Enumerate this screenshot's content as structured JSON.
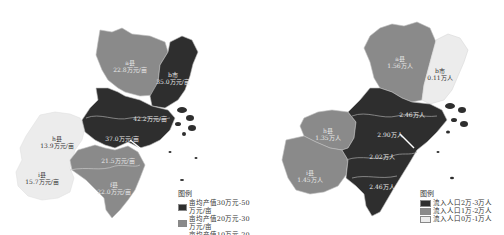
{
  "colors": {
    "dark": "#2e2e2e",
    "mid": "#8a8a8a",
    "light": "#ececec",
    "border": "#bdbdbd"
  },
  "left_map": {
    "regions": [
      {
        "id": "a",
        "name": "a县",
        "value": "22.8万元/亩",
        "class": "mid"
      },
      {
        "id": "b",
        "name": "b市",
        "value": "35.0万元/亩",
        "class": "dark"
      },
      {
        "id": "c",
        "name": "c区",
        "value": "42.2万元/亩",
        "class": "dark"
      },
      {
        "id": "d",
        "name": "d区",
        "value": "37.0万元/亩",
        "class": "dark"
      },
      {
        "id": "e",
        "name": "e县",
        "value": "21.5万元/亩",
        "class": "mid"
      },
      {
        "id": "f",
        "name": "f县",
        "value": "22.0万元/亩",
        "class": "mid"
      },
      {
        "id": "h",
        "name": "h县",
        "value": "13.9万元/亩",
        "class": "light"
      },
      {
        "id": "i",
        "name": "i县",
        "value": "15.7万元/亩",
        "class": "light"
      }
    ],
    "legend": {
      "title": "图例",
      "items": [
        {
          "label": "亩均产值30万元-50万元/亩",
          "class": "dark"
        },
        {
          "label": "亩均产值20万元-30万元/亩",
          "class": "mid"
        },
        {
          "label": "亩均产值10万元-20万元/亩",
          "class": "light"
        }
      ]
    }
  },
  "right_map": {
    "regions": [
      {
        "id": "a",
        "name": "a县",
        "value": "1.56万人",
        "class": "mid"
      },
      {
        "id": "b",
        "name": "b市",
        "value": "0.11万人",
        "class": "light"
      },
      {
        "id": "c",
        "name": "c区",
        "value": "2.46万人",
        "class": "dark"
      },
      {
        "id": "d",
        "name": "d区",
        "value": "2.90万人",
        "class": "dark"
      },
      {
        "id": "e",
        "name": "e区",
        "value": "2.02万人",
        "class": "dark"
      },
      {
        "id": "f",
        "name": "f县",
        "value": "2.46万人",
        "class": "dark"
      },
      {
        "id": "h",
        "name": "h县",
        "value": "1.35万人",
        "class": "mid"
      },
      {
        "id": "i",
        "name": "i县",
        "value": "1.45万人",
        "class": "mid"
      }
    ],
    "legend": {
      "title": "图例",
      "items": [
        {
          "label": "流入人口2万-3万人",
          "class": "dark"
        },
        {
          "label": "流入人口1万-2万人",
          "class": "mid"
        },
        {
          "label": "流入人口0万-1万人",
          "class": "light"
        }
      ]
    }
  }
}
